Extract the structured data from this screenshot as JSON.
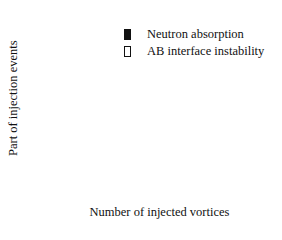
{
  "chart_data": {
    "type": "bar",
    "title": "",
    "xlabel": "Number of injected vortices",
    "ylabel": "Part of injection events",
    "xlim": [
      0,
      24
    ],
    "ylim": [
      0,
      0.55
    ],
    "xticks": [
      0,
      5,
      10,
      15,
      20
    ],
    "xtick_labels": [
      "0",
      "5",
      "10",
      "15",
      "20"
    ],
    "yticks": [
      0,
      0.1,
      0.2,
      0.3,
      0.4,
      0.5
    ],
    "ytick_labels": [
      "0",
      "0.1",
      "0.2",
      "0.3",
      "0.4",
      "0.5"
    ],
    "grid": false,
    "legend_position": "upper right",
    "series": [
      {
        "name": "Neutron absorption",
        "style": "filled",
        "color": "#111111",
        "x": [
          1,
          2,
          3,
          4,
          5
        ],
        "values": [
          0.545,
          0.27,
          0.13,
          0.05,
          0.01
        ]
      },
      {
        "name": "AB interface instability",
        "style": "open",
        "color": "#ffffff",
        "x": [
          3,
          4,
          5,
          6,
          7,
          8,
          9,
          10,
          11,
          12,
          13,
          14,
          15,
          16,
          17,
          18,
          19,
          20,
          21,
          22,
          23
        ],
        "values": [
          0.027,
          0.048,
          0.127,
          0.155,
          0.14,
          0.046,
          0.122,
          0.046,
          0.013,
          0.058,
          0.034,
          0.026,
          0.027,
          0.03,
          0.013,
          0.03,
          0.003,
          0.037,
          0.003,
          0.003,
          0.004
        ]
      }
    ]
  },
  "legend": {
    "items": [
      {
        "label": "Neutron absorption"
      },
      {
        "label": "AB interface instability"
      }
    ]
  }
}
